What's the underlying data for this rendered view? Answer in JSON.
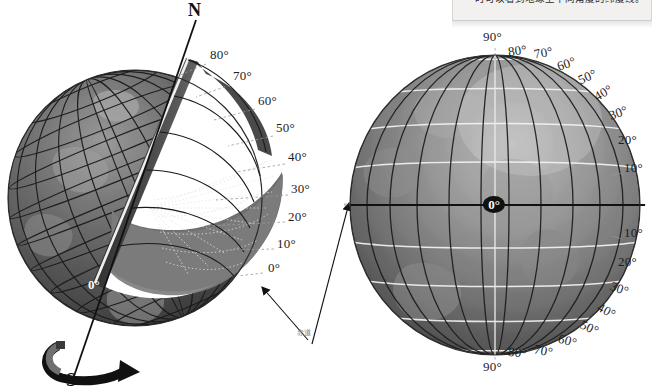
{
  "caption": {
    "text": "时可以看到地球上不同角度的纬度线。"
  },
  "colors": {
    "background": "#ffffff",
    "globe_left_dark": "#4b4b4b",
    "globe_left_light": "#8e8e8e",
    "globe_right_mid": "#7a7a7a",
    "grid_dark": "#1e1e1e",
    "grid_white": "#f2f2f2",
    "label_text": "#1d1d1d",
    "cn_label": "#8d8d8d"
  },
  "left_globe": {
    "name": "tilted-cutaway-globe",
    "pole_north": "N",
    "pole_south": "S",
    "center_zero": "0°",
    "equator_cn": "赤道",
    "latitude_labels": [
      {
        "text": "80°",
        "x": 210,
        "y": 54,
        "lx": 206,
        "ly": 64,
        "tx": 178,
        "ty": 76
      },
      {
        "text": "70°",
        "x": 233,
        "y": 75,
        "lx": 230,
        "ly": 85,
        "tx": 196,
        "ty": 97
      },
      {
        "text": "60°",
        "x": 258,
        "y": 100,
        "lx": 255,
        "ly": 109,
        "tx": 214,
        "ty": 120
      },
      {
        "text": "50°",
        "x": 276,
        "y": 127,
        "lx": 273,
        "ly": 136,
        "tx": 228,
        "ty": 146
      },
      {
        "text": "40°",
        "x": 288,
        "y": 156,
        "lx": 285,
        "ly": 164,
        "tx": 236,
        "ty": 172
      },
      {
        "text": "30°",
        "x": 291,
        "y": 188,
        "lx": 288,
        "ly": 195,
        "tx": 216,
        "ty": 200
      },
      {
        "text": "20°",
        "x": 288,
        "y": 216,
        "lx": 285,
        "ly": 222,
        "tx": 208,
        "ty": 226
      },
      {
        "text": "10°",
        "x": 277,
        "y": 243,
        "lx": 274,
        "ly": 249,
        "tx": 228,
        "ty": 250
      },
      {
        "text": "0°",
        "x": 265,
        "y": 267,
        "lx": 263,
        "ly": 273,
        "tx": 238,
        "ty": 276
      }
    ]
  },
  "right_globe": {
    "name": "front-view-globe",
    "equator_label": "0°",
    "north_labels": [
      {
        "text": "90°",
        "x": 483,
        "y": 36
      },
      {
        "text": "80°",
        "x": 508,
        "y": 50
      },
      {
        "text": "70°",
        "x": 534,
        "y": 52
      },
      {
        "text": "60°",
        "x": 557,
        "y": 63
      },
      {
        "text": "50°",
        "x": 578,
        "y": 76
      },
      {
        "text": "40°",
        "x": 594,
        "y": 92
      },
      {
        "text": "30°",
        "x": 609,
        "y": 112
      },
      {
        "text": "20°",
        "x": 618,
        "y": 139
      },
      {
        "text": "10°",
        "x": 624,
        "y": 167
      }
    ],
    "south_labels": [
      {
        "text": "10°",
        "x": 624,
        "y": 232
      },
      {
        "text": "20°",
        "x": 618,
        "y": 261
      },
      {
        "text": "30°",
        "x": 610,
        "y": 288
      },
      {
        "text": "40°",
        "x": 597,
        "y": 310
      },
      {
        "text": "50°",
        "x": 580,
        "y": 327
      },
      {
        "text": "60°",
        "x": 558,
        "y": 340
      },
      {
        "text": "70°",
        "x": 534,
        "y": 350
      },
      {
        "text": "80°",
        "x": 508,
        "y": 352
      },
      {
        "text": "90°",
        "x": 483,
        "y": 366
      }
    ]
  }
}
